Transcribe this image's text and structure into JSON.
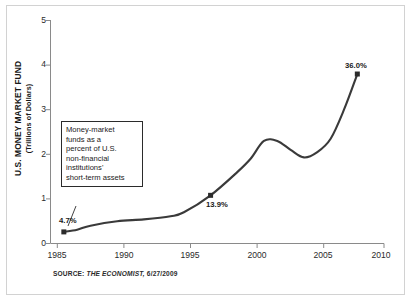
{
  "chart_data": {
    "type": "line",
    "title": "",
    "xlabel": "",
    "ylabel": "U.S. MONEY MARKET FUND",
    "ylabel_sub": "(Trillions of Dollars)",
    "xlim": [
      1985,
      2010
    ],
    "ylim": [
      0,
      5
    ],
    "grid": false,
    "legend": "none",
    "xticks": [
      "1985",
      "1990",
      "1995",
      "2000",
      "2005",
      "2010"
    ],
    "yticks": [
      "0",
      "1",
      "2",
      "3",
      "4",
      "5"
    ],
    "x": [
      1986,
      1987,
      1988,
      1990,
      1992,
      1994,
      1995,
      1997,
      1999,
      2000,
      2001,
      2002,
      2003,
      2004,
      2005,
      2006,
      2007,
      2008
    ],
    "values": [
      0.26,
      0.31,
      0.4,
      0.5,
      0.54,
      0.61,
      0.7,
      1.08,
      1.6,
      1.9,
      2.3,
      2.3,
      2.1,
      1.93,
      2.05,
      2.35,
      3.0,
      3.8
    ],
    "markers": [
      {
        "x": 1986,
        "y": 0.26,
        "label": "4.7%"
      },
      {
        "x": 1997,
        "y": 1.08,
        "label": "13.9%"
      },
      {
        "x": 2008,
        "y": 3.8,
        "label": "36.0%"
      }
    ],
    "annotation": {
      "lines": [
        "Money-market",
        "funds as a",
        "percent of U.S.",
        "non-financial",
        "institutions'",
        "short-term assets"
      ],
      "points_to": {
        "x": 1986,
        "y": 0.26
      }
    },
    "line_color": "#3a3a3a",
    "marker_color": "#2b2b2b",
    "axis_color": "#8a8a8a"
  },
  "source": {
    "prefix": "SOURCE:",
    "publication": "THE ECONOMIST,",
    "date": "6/27/2009"
  },
  "labels": {
    "pct_first": "4.7%",
    "pct_mid": "13.9%",
    "pct_last": "36.0%"
  }
}
